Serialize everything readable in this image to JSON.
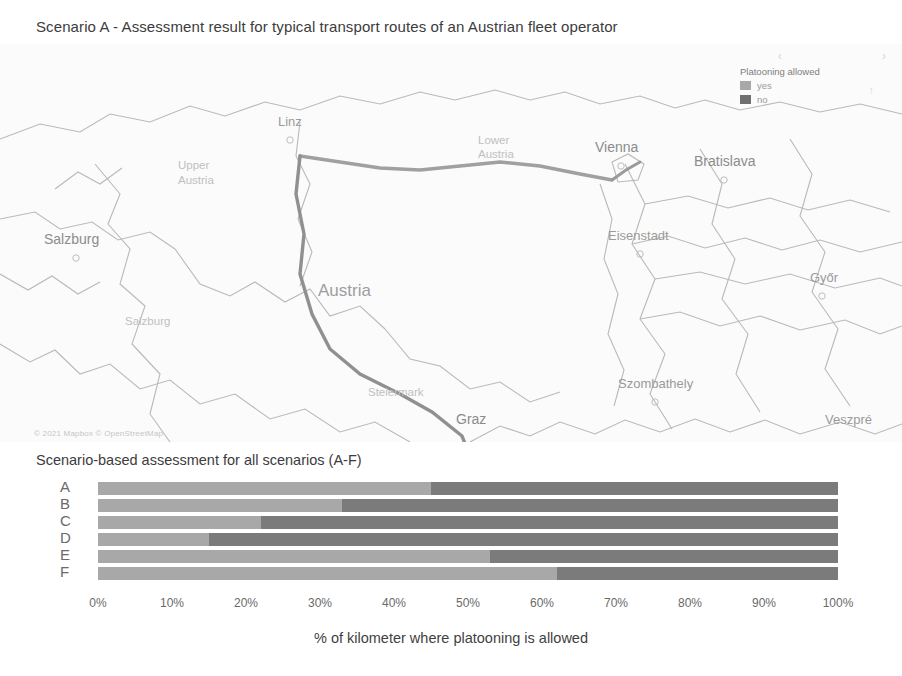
{
  "top": {
    "title": "Scenario A - Assessment result for typical transport routes of an Austrian fleet operator"
  },
  "map": {
    "legend": {
      "title": "Platooning allowed",
      "items": [
        {
          "label": "yes",
          "color": "#a8a8a8"
        },
        {
          "label": "no",
          "color": "#6f6f6f"
        }
      ],
      "chevron_left": "‹",
      "chevron_right": "›",
      "compass": "↑"
    },
    "attribution": "© 2021 Mapbox © OpenStreetMap",
    "country_label": "Austria",
    "cities": [
      {
        "name": "Linz",
        "x": 297,
        "y": 82,
        "dot": true
      },
      {
        "name": "Vienna",
        "x": 625,
        "y": 105,
        "dot": true
      },
      {
        "name": "Bratislava",
        "x": 727,
        "y": 118,
        "dot": true
      },
      {
        "name": "Salzburg",
        "x": 76,
        "y": 198,
        "dot": true
      },
      {
        "name": "Eisenstadt",
        "x": 650,
        "y": 193,
        "dot": true
      },
      {
        "name": "Győr",
        "x": 824,
        "y": 237,
        "dot": true
      },
      {
        "name": "Szombathely",
        "x": 657,
        "y": 341,
        "dot": true
      },
      {
        "name": "Graz",
        "x": 472,
        "y": 378,
        "dot": true
      },
      {
        "name": "Veszpré",
        "x": 848,
        "y": 379,
        "dot": false
      },
      {
        "name": "Zalaegerszeg",
        "x": 684,
        "y": 435,
        "dot": false
      }
    ],
    "regions": [
      {
        "name": "Upper",
        "x": 178,
        "y": 125
      },
      {
        "name": "Austria",
        "x": 178,
        "y": 140
      },
      {
        "name": "Lower",
        "x": 485,
        "y": 100
      },
      {
        "name": "Austria",
        "x": 485,
        "y": 114
      },
      {
        "name": "Salzburg",
        "x": 125,
        "y": 281
      },
      {
        "name": "Steiermark",
        "x": 385,
        "y": 352
      }
    ]
  },
  "chart_data": {
    "type": "bar",
    "orientation": "horizontal",
    "stacked": true,
    "title": "Scenario-based assessment for all scenarios (A-F)",
    "xlabel": "% of kilometer where platooning is allowed",
    "ylabel": "",
    "xlim": [
      0,
      100
    ],
    "grid": false,
    "legend_position": "map-overlay",
    "categories": [
      "A",
      "B",
      "C",
      "D",
      "E",
      "F"
    ],
    "tick_labels": [
      "0%",
      "10%",
      "20%",
      "30%",
      "40%",
      "50%",
      "60%",
      "70%",
      "80%",
      "90%",
      "100%"
    ],
    "tick_values": [
      0,
      10,
      20,
      30,
      40,
      50,
      60,
      70,
      80,
      90,
      100
    ],
    "series": [
      {
        "name": "yes",
        "color": "#a8a8a8",
        "values": [
          45,
          33,
          22,
          15,
          53,
          62
        ]
      },
      {
        "name": "no",
        "color": "#7b7b7b",
        "values": [
          55,
          67,
          78,
          85,
          47,
          38
        ]
      }
    ]
  }
}
